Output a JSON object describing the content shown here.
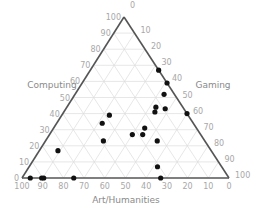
{
  "chart_data": {
    "type": "scatter",
    "subtype": "ternary",
    "title": "",
    "axes": {
      "top": {
        "label": "Computing",
        "ticks": [
          0,
          10,
          20,
          30,
          40,
          50,
          60,
          70,
          80,
          90,
          100
        ]
      },
      "right": {
        "label": "Gaming",
        "ticks": [
          0,
          10,
          20,
          30,
          40,
          50,
          60,
          70,
          80,
          90,
          100
        ]
      },
      "bottom": {
        "label": "Art/Humanities",
        "ticks": [
          100,
          90,
          80,
          70,
          60,
          50,
          40,
          30,
          20,
          10,
          0
        ]
      }
    },
    "grid": true,
    "points": [
      {
        "computing": 67,
        "gaming": 33,
        "art": 0
      },
      {
        "computing": 59,
        "gaming": 41,
        "art": 0
      },
      {
        "computing": 52,
        "gaming": 43,
        "art": 5
      },
      {
        "computing": 44,
        "gaming": 43,
        "art": 13
      },
      {
        "computing": 43,
        "gaming": 48,
        "art": 9
      },
      {
        "computing": 41,
        "gaming": 44,
        "art": 15
      },
      {
        "computing": 40,
        "gaming": 60,
        "art": 0
      },
      {
        "computing": 39,
        "gaming": 23,
        "art": 38
      },
      {
        "computing": 34,
        "gaming": 22,
        "art": 44
      },
      {
        "computing": 31,
        "gaming": 44,
        "art": 25
      },
      {
        "computing": 27,
        "gaming": 40,
        "art": 33
      },
      {
        "computing": 27,
        "gaming": 45,
        "art": 28
      },
      {
        "computing": 23,
        "gaming": 28,
        "art": 49
      },
      {
        "computing": 23,
        "gaming": 54,
        "art": 23
      },
      {
        "computing": 17,
        "gaming": 9,
        "art": 74
      },
      {
        "computing": 7,
        "gaming": 62,
        "art": 31
      },
      {
        "computing": 0,
        "gaming": 4,
        "art": 96
      },
      {
        "computing": 0,
        "gaming": 9.5,
        "art": 90.5
      },
      {
        "computing": 0,
        "gaming": 10.5,
        "art": 89.5
      },
      {
        "computing": 0,
        "gaming": 25,
        "art": 75
      },
      {
        "computing": 0,
        "gaming": 67,
        "art": 33
      }
    ]
  },
  "colors": {
    "edge": "#555555",
    "grid": "#dddddd",
    "tick": "#a8a8a8",
    "label": "#8a8a8a",
    "point": "#111111"
  }
}
